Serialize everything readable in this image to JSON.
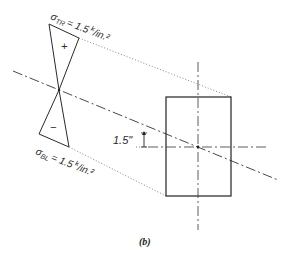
{
  "figure": {
    "caption": "(b)",
    "top_stress_label": "σTR = 1.5 k/in.²",
    "top_stress": {
      "symbol": "σ",
      "subscript": "TR",
      "eq": "= 1.5",
      "unit_k": "k",
      "unit_rest": "/in.²"
    },
    "bottom_stress": {
      "symbol": "σ",
      "subscript": "BL",
      "eq": "= 1.5",
      "unit_k": "k",
      "unit_rest": "/in.²"
    },
    "plus_sign": "+",
    "minus_sign": "−",
    "dimension_label": "1.5\"",
    "colors": {
      "line": "#2a2a2a",
      "background": "#ffffff"
    }
  }
}
